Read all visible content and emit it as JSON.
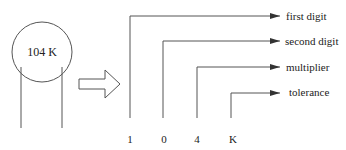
{
  "component": {
    "label": "104 K"
  },
  "code_digits": [
    {
      "char": "1",
      "meaning": "first digit"
    },
    {
      "char": "0",
      "meaning": "second digit"
    },
    {
      "char": "4",
      "meaning": "multiplier"
    },
    {
      "char": "K",
      "meaning": "tolerance"
    }
  ],
  "colors": {
    "line": "#555555",
    "text": "#222222",
    "background": "#ffffff"
  }
}
